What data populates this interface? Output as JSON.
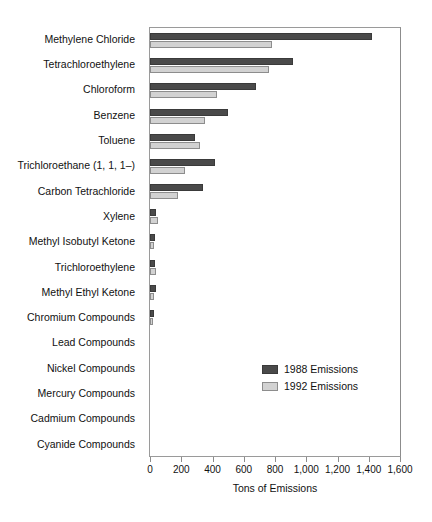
{
  "chart_data": {
    "type": "bar",
    "orientation": "horizontal",
    "title": "",
    "xlabel": "Tons of Emissions",
    "ylabel": "",
    "xlim": [
      0,
      1600
    ],
    "xticks": [
      0,
      200,
      400,
      600,
      800,
      1000,
      1200,
      1400,
      1600
    ],
    "xtick_labels": [
      "0",
      "200",
      "400",
      "600",
      "800",
      "1,000",
      "1,200",
      "1,400",
      "1,600"
    ],
    "grid": false,
    "legend_position": "center-right-inside",
    "categories": [
      "Methylene Chloride",
      "Tetrachloroethylene",
      "Chloroform",
      "Benzene",
      "Toluene",
      "Trichloroethane (1, 1, 1–)",
      "Carbon Tetrachloride",
      "Xylene",
      "Methyl Isobutyl Ketone",
      "Trichloroethylene",
      "Methyl Ethyl Ketone",
      "Chromium Compounds",
      "Lead Compounds",
      "Nickel Compounds",
      "Mercury Compounds",
      "Cadmium Compounds",
      "Cyanide Compounds"
    ],
    "series": [
      {
        "name": "1988 Emissions",
        "color": "#4a4a4a",
        "values": [
          1420,
          915,
          680,
          500,
          290,
          415,
          340,
          38,
          30,
          35,
          40,
          25,
          0,
          0,
          0,
          0,
          0
        ]
      },
      {
        "name": "1992 Emissions",
        "color": "#d2d2d2",
        "values": [
          780,
          760,
          430,
          350,
          320,
          225,
          180,
          50,
          28,
          40,
          26,
          12,
          0,
          0,
          0,
          0,
          0
        ]
      }
    ]
  },
  "legend": {
    "items": [
      {
        "label": "1988 Emissions"
      },
      {
        "label": "1992 Emissions"
      }
    ]
  }
}
